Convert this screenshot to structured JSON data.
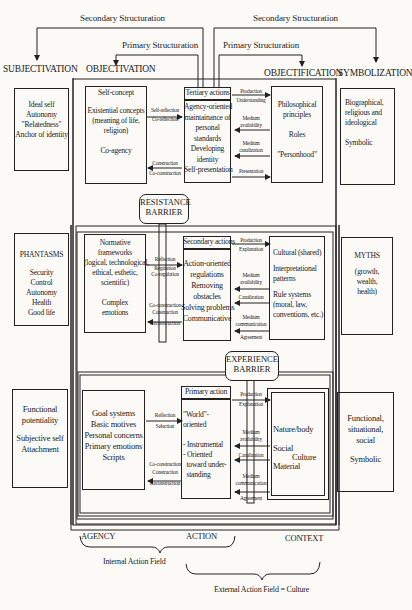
{
  "structuration": {
    "secondary_left": "Secondary Structuration",
    "secondary_right": "Secondary Structuration",
    "primary_left": "Primary Structuration",
    "primary_right": "Primary Structuration"
  },
  "headers": {
    "subjectivation": "SUBJECTIVATION",
    "objectivation": "OBJECTIVATION",
    "objectification": "OBJECTIFICATION",
    "symbolization": "SYMBOLIZATION"
  },
  "barriers": {
    "resistance": [
      "RESISTANCE",
      "BARRIER"
    ],
    "experience": [
      "EXPERIENCE",
      "BARRIER"
    ]
  },
  "rows": [
    {
      "subject": [
        "Ideal self",
        "Autonomy",
        "\"Relatedness\"",
        "Anchor of identity"
      ],
      "agency": [
        "Self-concept",
        "",
        "Existential concepts",
        "(meaning of life,",
        "religion)",
        "",
        "Co-agency"
      ],
      "agency_to_action": [
        "Self-reflection",
        "Co-reflection"
      ],
      "action_to_agency": [
        "Construction",
        "Co-construction"
      ],
      "action_title": "Tertiary actions",
      "action": [
        "Agency-oriented",
        "maintainance of",
        "personal",
        "standards",
        "Developing",
        "identity",
        "Self-presentation"
      ],
      "ctx_arrows": [
        [
          "Production",
          "Understanding"
        ],
        [
          "Medium",
          "availability"
        ],
        [
          "Medium",
          "canalization"
        ],
        [
          "Presentation"
        ]
      ],
      "context": [
        "Philosophical",
        "principles",
        "",
        "Roles",
        "",
        "\"Personhood\""
      ],
      "symbol": [
        "Biographical,",
        "religious and",
        "ideological",
        "",
        "Symbolic"
      ]
    },
    {
      "subject": [
        "PHANTASMS",
        "",
        "Security",
        "Control",
        "Autonomy",
        "Health",
        "Good life"
      ],
      "agency": [
        "Normative",
        "frameworks",
        "(logical, technological,",
        "ethical, esthetic,",
        "scientific)",
        "",
        "Complex",
        "emotions"
      ],
      "agency_to_action": [
        "Reflection",
        "Regulation",
        "Co-regulation"
      ],
      "action_to_agency": [
        "Co-construction",
        "Construction",
        "",
        "Reconstruction"
      ],
      "action_title": "Secondary actions",
      "action": [
        "Action-oriented",
        "regulations",
        "Removing",
        "obstacles",
        "Solving problems",
        "Communicative"
      ],
      "ctx_arrows": [
        [
          "Production",
          "Explanation"
        ],
        [
          "Medium",
          "availability"
        ],
        [
          "Canalization"
        ],
        [
          "Medium",
          "communication"
        ],
        [
          "Agreement"
        ]
      ],
      "context": [
        "Cultural (shared)",
        "",
        "Interpretational",
        "patterns",
        "",
        "Rule systems",
        "(moral, law,",
        "conventions, etc.)"
      ],
      "symbol": [
        "MYTHS",
        "",
        "(growth,",
        "wealth,",
        "health)"
      ]
    },
    {
      "subject": [
        "Functional",
        "potentiality",
        "",
        "Subjective self",
        "Attachment"
      ],
      "agency": [
        "Goal systems",
        "Basic motives",
        "Personal concerns",
        "Primary emotions",
        "Scripts"
      ],
      "agency_to_action": [
        "Reflection",
        "Selection"
      ],
      "action_to_agency": [
        "Co-construction",
        "Construction",
        "",
        "Reconstruction"
      ],
      "action_title": "Primary action",
      "action": [
        "\"World\"-",
        "oriented",
        "",
        "- Instrumental",
        "- Oriented",
        "  toward under-",
        "  standing"
      ],
      "ctx_arrows": [
        [
          "Production",
          "Explanation"
        ],
        [
          "Medium",
          "availability"
        ],
        [
          "Canalization"
        ],
        [
          "Medium",
          "communication"
        ],
        [
          "Agreement"
        ]
      ],
      "context": {
        "nature": "Nature/body",
        "social": "Social",
        "culture": "Culture",
        "material": "Material"
      },
      "symbol": [
        "Functional,",
        "situational,",
        "social",
        "",
        "Symbolic"
      ]
    }
  ],
  "footer": {
    "agency": "AGENCY",
    "action": "ACTION",
    "context": "CONTEXT",
    "internal": "Internal Action Field",
    "external": "External Action Field = Culture"
  }
}
